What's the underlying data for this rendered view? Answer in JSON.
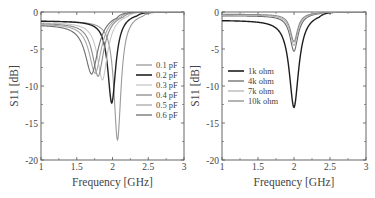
{
  "chart_data": [
    {
      "type": "line",
      "title": "",
      "xlabel": "Frequency [GHz]",
      "ylabel": "S11 [dB]",
      "xlim": [
        1,
        3
      ],
      "ylim": [
        -20,
        0
      ],
      "xticks": [
        "1",
        "1.5",
        "2",
        "2.5",
        "3"
      ],
      "yticks": [
        "0",
        "-5",
        "-10",
        "-15",
        "-20"
      ],
      "grid": false,
      "legend_position": "center-right",
      "series": [
        {
          "name": "0.1 pF",
          "color": "#9a9a9a",
          "width": 1.1,
          "f0": 2.07,
          "min": -17.3,
          "base": -1.2,
          "q": 0.075
        },
        {
          "name": "0.2 pF",
          "color": "#222222",
          "width": 1.4,
          "f0": 1.99,
          "min": -12.3,
          "base": -1.2,
          "q": 0.085
        },
        {
          "name": "0.3 pF",
          "color": "#c8c8c8",
          "width": 1.1,
          "f0": 1.86,
          "min": -9.2,
          "base": -1.4,
          "q": 0.11
        },
        {
          "name": "0.4 pF",
          "color": "#8a8a8a",
          "width": 1.1,
          "f0": 1.8,
          "min": -8.7,
          "base": -1.5,
          "q": 0.12
        },
        {
          "name": "0.5 pF",
          "color": "#a8a8a8",
          "width": 1.1,
          "f0": 1.76,
          "min": -8.3,
          "base": -1.6,
          "q": 0.13
        },
        {
          "name": "0.6 pF",
          "color": "#6e6e6e",
          "width": 1.1,
          "f0": 1.71,
          "min": -8.4,
          "base": -1.7,
          "q": 0.14
        }
      ]
    },
    {
      "type": "line",
      "title": "",
      "xlabel": "Frequency [GHz]",
      "ylabel": "S11 [dB]",
      "xlim": [
        1,
        3
      ],
      "ylim": [
        -20,
        0
      ],
      "xticks": [
        "1",
        "1.5",
        "2",
        "2.5",
        "3"
      ],
      "yticks": [
        "0",
        "-5",
        "-10",
        "-15",
        "-20"
      ],
      "grid": false,
      "legend_position": "center-left",
      "series": [
        {
          "name": "1k ohm",
          "color": "#1e1e1e",
          "width": 1.4,
          "f0": 2.0,
          "min": -12.9,
          "base": -1.1,
          "q": 0.1
        },
        {
          "name": "4k ohm",
          "color": "#6a6a6a",
          "width": 1.1,
          "f0": 2.0,
          "min": -5.3,
          "base": -0.5,
          "q": 0.085
        },
        {
          "name": "7k ohm",
          "color": "#b4b4b4",
          "width": 1.1,
          "f0": 2.0,
          "min": -4.5,
          "base": -0.4,
          "q": 0.08
        },
        {
          "name": "10k ohm",
          "color": "#8c8c8c",
          "width": 1.1,
          "f0": 2.0,
          "min": -4.0,
          "base": -0.3,
          "q": 0.075
        }
      ]
    }
  ]
}
